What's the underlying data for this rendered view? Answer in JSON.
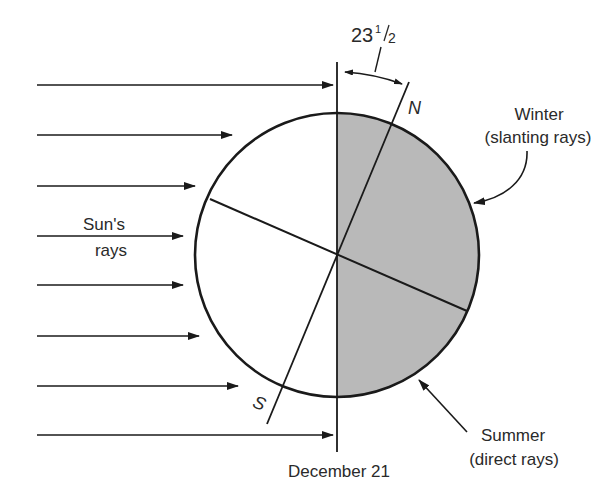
{
  "diagram": {
    "type": "earth-tilt-solstice",
    "date_label": "December 21",
    "tilt_label": "23",
    "tilt_fraction_num": "1",
    "tilt_fraction_den": "2",
    "sun_rays_label_line1": "Sun's",
    "sun_rays_label_line2": "rays",
    "north_label": "N",
    "south_label": "S",
    "winter_label_line1": "Winter",
    "winter_label_line2": "(slanting rays)",
    "summer_label_line1": "Summer",
    "summer_label_line2": "(direct rays)"
  },
  "colors": {
    "line": "#1a1a1a",
    "shade": "#b9b9b9",
    "background": "#ffffff",
    "text": "#2a2a2a"
  },
  "geometry": {
    "earth_center": [
      337,
      255
    ],
    "earth_radius": 142,
    "axis_tilt_degrees": 23.5,
    "ray_count": 8
  }
}
